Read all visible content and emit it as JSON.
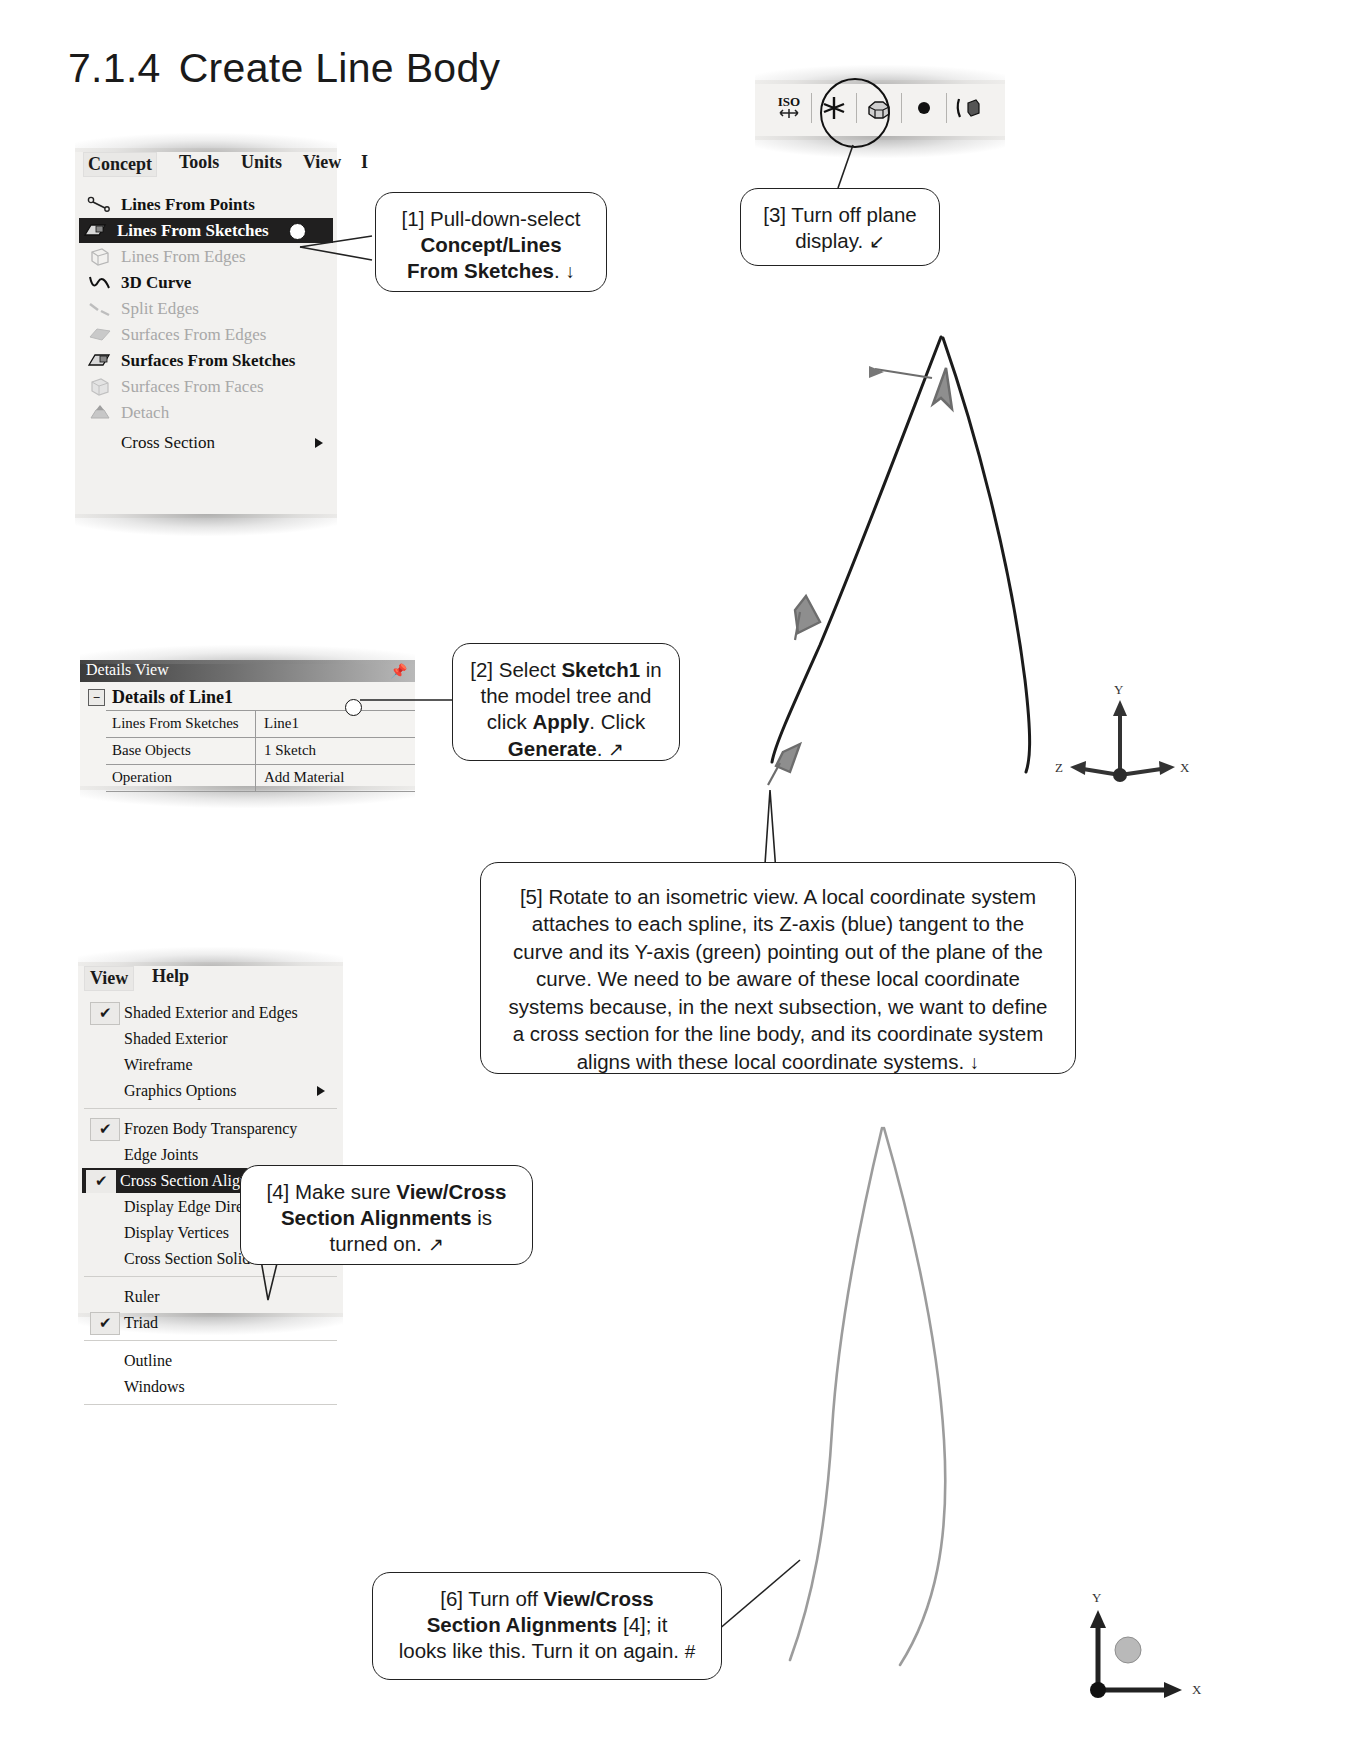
{
  "page": {
    "section_number": "7.1.4",
    "section_title": "Create Line Body"
  },
  "concept_menu": {
    "menubar": [
      "Concept",
      "Tools",
      "Units",
      "View",
      "I"
    ],
    "items": [
      {
        "label": "Lines From Points",
        "state": "bold",
        "icon": "lines-from-points-icon"
      },
      {
        "label": "Lines From Sketches",
        "state": "selected",
        "icon": "lines-from-sketches-icon"
      },
      {
        "label": "Lines From Edges",
        "state": "disabled",
        "icon": "lines-from-edges-icon"
      },
      {
        "label": "3D Curve",
        "state": "bold",
        "icon": "3d-curve-icon"
      },
      {
        "label": "Split Edges",
        "state": "disabled",
        "icon": "split-edges-icon"
      },
      {
        "label": "Surfaces From Edges",
        "state": "disabled",
        "icon": "surfaces-from-edges-icon"
      },
      {
        "label": "Surfaces From Sketches",
        "state": "bold",
        "icon": "surfaces-from-sketches-icon"
      },
      {
        "label": "Surfaces From Faces",
        "state": "disabled",
        "icon": "surfaces-from-faces-icon"
      },
      {
        "label": "Detach",
        "state": "disabled",
        "icon": "detach-icon"
      },
      {
        "label": "Cross Section",
        "state": "normal",
        "icon": "none",
        "submenu": true
      }
    ]
  },
  "details_view": {
    "title": "Details View",
    "header": "Details of Line1",
    "expander": "−",
    "rows": [
      {
        "key": "Lines From Sketches",
        "value": "Line1"
      },
      {
        "key": "Base Objects",
        "value": "1 Sketch"
      },
      {
        "key": "Operation",
        "value": "Add Material"
      }
    ]
  },
  "view_menu": {
    "menubar": [
      "View",
      "Help"
    ],
    "items": [
      {
        "label": "Shaded Exterior and Edges",
        "checked": true,
        "state": "normal"
      },
      {
        "label": "Shaded Exterior",
        "checked": false,
        "state": "normal"
      },
      {
        "label": "Wireframe",
        "checked": false,
        "state": "normal"
      },
      {
        "label": "Graphics Options",
        "checked": false,
        "state": "normal",
        "submenu": true
      },
      {
        "label": "Frozen Body Transparency",
        "checked": true,
        "state": "normal"
      },
      {
        "label": "Edge Joints",
        "checked": false,
        "state": "normal"
      },
      {
        "label": "Cross Section Alignments",
        "checked": true,
        "state": "selected"
      },
      {
        "label": "Display Edge Direction",
        "checked": false,
        "state": "normal"
      },
      {
        "label": "Display Vertices",
        "checked": false,
        "state": "normal"
      },
      {
        "label": "Cross Section Solids",
        "checked": false,
        "state": "normal"
      },
      {
        "label": "Ruler",
        "checked": false,
        "state": "normal"
      },
      {
        "label": "Triad",
        "checked": true,
        "state": "normal"
      },
      {
        "label": "Outline",
        "checked": false,
        "state": "normal"
      },
      {
        "label": "Windows",
        "checked": false,
        "state": "normal"
      }
    ],
    "check_glyph": "✔"
  },
  "toolbar": {
    "buttons": [
      {
        "name": "iso-view-button",
        "label": "ISO"
      },
      {
        "name": "display-planes-button",
        "label": ""
      },
      {
        "name": "display-model-button",
        "label": ""
      },
      {
        "name": "display-points-button",
        "label": ""
      },
      {
        "name": "display-edges-button",
        "label": ""
      }
    ]
  },
  "callouts": {
    "c1": {
      "line1": "[1] Pull-down-select",
      "line2_bold": "Concept/Lines",
      "line3_bold": "From Sketches",
      "line3_tail": ".",
      "arrow": "↓"
    },
    "c2": {
      "line1_a": "[2] Select ",
      "line1_bold": "Sketch1",
      "line1_b": " in",
      "line2": "the model tree and",
      "line3_a": "click ",
      "line3_bold": "Apply",
      "line3_b": ".  Click",
      "line4_bold": "Generate",
      "line4_tail": ".",
      "arrow": "↗"
    },
    "c3": {
      "line1": "[3] Turn off plane",
      "line2": "display.",
      "arrow": "↙"
    },
    "c4": {
      "line1_a": "[4] Make sure ",
      "line1_bold": "View/Cross",
      "line2_bold": "Section Alignments",
      "line2_b": " is",
      "line3": "turned on.",
      "arrow": "↗"
    },
    "c5": {
      "text": "[5] Rotate to an isometric view.  A local coordinate system attaches to each spline, its Z-axis (blue) tangent to the curve and its Y-axis (green) pointing out of the plane of the curve. We need to be aware of these local coordinate systems because, in the next subsection, we want to define a cross section for the line body, and its coordinate system aligns with these local coordinate systems.",
      "arrow": "↓"
    },
    "c6": {
      "line1_a": "[6] Turn off ",
      "line1_bold": "View/Cross",
      "line2_bold": "Section Alignments",
      "line2_b": " [4]; it",
      "line3": "looks like this.  Turn it on again.",
      "arrow": "#"
    }
  },
  "viewport_top": {
    "triad_labels": {
      "x": "X",
      "y": "Y",
      "z": "Z"
    }
  },
  "viewport_bottom": {
    "triad_labels": {
      "x": "X",
      "y": "Y"
    }
  }
}
